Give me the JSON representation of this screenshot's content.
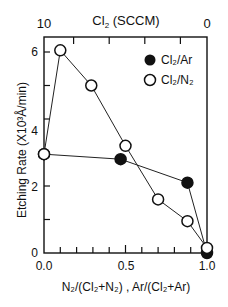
{
  "chart_data": {
    "type": "line",
    "title": "",
    "xlabel": "N2/(Cl2+N2) , Ar/(Cl2+Ar)",
    "ylabel": "Etching Rate (×10³Å/min)",
    "top_xlabel": "Cl2 (SCCM)",
    "xlim": [
      0,
      1
    ],
    "ylim": [
      0,
      6.5
    ],
    "top_xlim": [
      10,
      0
    ],
    "x_ticks": [
      "0.0",
      "0.5",
      "1.0"
    ],
    "y_ticks": [
      "0",
      "2",
      "4",
      "6"
    ],
    "top_x_ticks": [
      "10",
      "0"
    ],
    "grid": false,
    "legend_position": "upper right",
    "series": [
      {
        "name": "Cl2/Ar",
        "marker": "filled-circle",
        "x": [
          0.0,
          0.47,
          0.88,
          1.0
        ],
        "y": [
          2.95,
          2.8,
          2.1,
          0.0
        ]
      },
      {
        "name": "Cl2/N2",
        "marker": "open-circle",
        "x": [
          0.0,
          0.1,
          0.29,
          0.5,
          0.7,
          0.88,
          1.0
        ],
        "y": [
          2.95,
          6.05,
          5.0,
          3.2,
          1.6,
          0.95,
          0.15
        ]
      }
    ]
  },
  "labels": {
    "top_axis_title": "Cl",
    "top_axis_sub": "2",
    "top_axis_rest": " (SCCM)",
    "top_tick_left": "10",
    "top_tick_right": "0",
    "y_ticks": [
      "0",
      "2",
      "4",
      "6"
    ],
    "x_ticks": [
      "0.0",
      "0.5",
      "1.0"
    ],
    "legend_ar": "Cl₂/Ar",
    "legend_n2": "Cl₂/N₂",
    "xlabel": "N₂/(Cl₂+N₂) , Ar/(Cl₂+Ar)",
    "ylabel": "Etching Rate (X10³Å/min)"
  }
}
